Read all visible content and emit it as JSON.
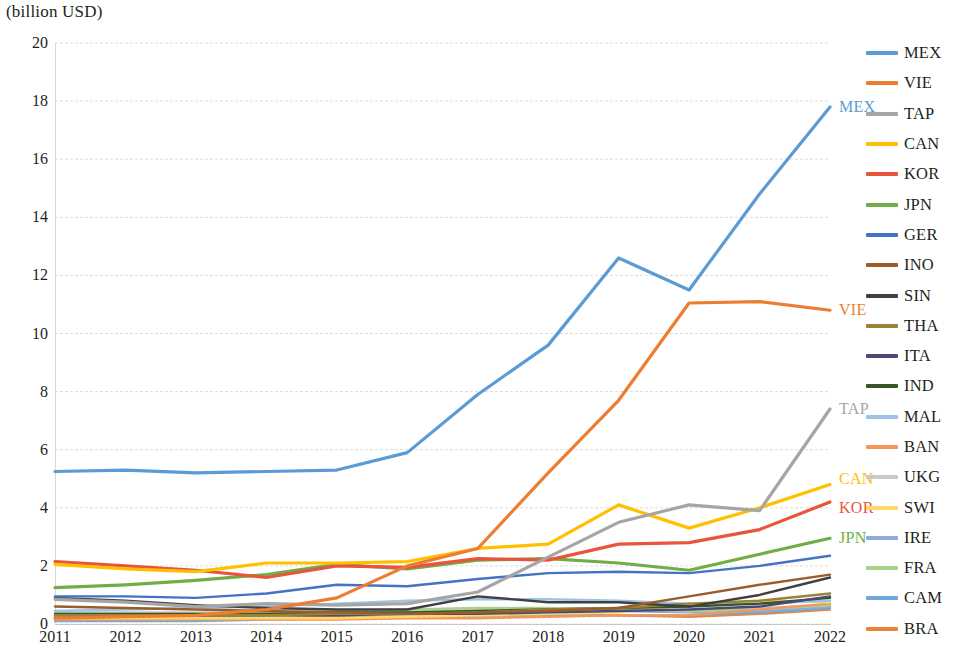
{
  "chart_data": {
    "type": "line",
    "title": "(billion USD)",
    "xlabel": "",
    "ylabel": "(billion USD)",
    "x": [
      2011,
      2012,
      2013,
      2014,
      2015,
      2016,
      2017,
      2018,
      2019,
      2020,
      2021,
      2022
    ],
    "xlim": [
      2011,
      2022
    ],
    "ylim": [
      0,
      20
    ],
    "yticks": [
      0,
      2,
      4,
      6,
      8,
      10,
      12,
      14,
      16,
      18,
      20
    ],
    "grid": true,
    "legend_position": "right",
    "series": [
      {
        "name": "MEX",
        "color": "#5B9BD5",
        "end_label": "MEX",
        "values": [
          5.25,
          5.3,
          5.2,
          5.25,
          5.3,
          5.9,
          7.9,
          9.6,
          12.6,
          11.5,
          14.8,
          17.8
        ]
      },
      {
        "name": "VIE",
        "color": "#ED7D31",
        "end_label": "VIE",
        "values": [
          0.2,
          0.25,
          0.3,
          0.5,
          0.9,
          2.0,
          2.6,
          5.2,
          7.7,
          11.05,
          11.1,
          10.8
        ]
      },
      {
        "name": "TAP",
        "color": "#A5A5A5",
        "end_label": "TAP",
        "values": [
          0.85,
          0.75,
          0.6,
          0.7,
          0.65,
          0.7,
          1.1,
          2.3,
          3.5,
          4.1,
          3.9,
          7.4
        ]
      },
      {
        "name": "CAN",
        "color": "#FFC000",
        "end_label": "CAN",
        "values": [
          2.05,
          1.9,
          1.8,
          2.1,
          2.1,
          2.15,
          2.6,
          2.75,
          4.1,
          3.3,
          4.0,
          4.8
        ]
      },
      {
        "name": "KOR",
        "color": "#E8553C",
        "end_label": "KOR",
        "values": [
          2.15,
          2.0,
          1.85,
          1.6,
          2.0,
          1.95,
          2.25,
          2.2,
          2.75,
          2.8,
          3.25,
          4.2
        ]
      },
      {
        "name": "JPN",
        "color": "#70AD47",
        "end_label": "JPN",
        "values": [
          1.25,
          1.35,
          1.5,
          1.7,
          2.05,
          1.9,
          2.2,
          2.25,
          2.1,
          1.85,
          2.4,
          2.95
        ]
      },
      {
        "name": "GER",
        "color": "#4472C4",
        "end_label": "",
        "values": [
          0.95,
          0.95,
          0.9,
          1.05,
          1.35,
          1.3,
          1.55,
          1.75,
          1.8,
          1.75,
          2.0,
          2.35
        ]
      },
      {
        "name": "INO",
        "color": "#9A5C2B",
        "end_label": "",
        "values": [
          0.6,
          0.55,
          0.5,
          0.45,
          0.4,
          0.35,
          0.4,
          0.45,
          0.55,
          0.95,
          1.35,
          1.7
        ]
      },
      {
        "name": "SIN",
        "color": "#404040",
        "end_label": "",
        "values": [
          0.9,
          0.8,
          0.65,
          0.55,
          0.5,
          0.5,
          0.95,
          0.75,
          0.75,
          0.6,
          1.0,
          1.6
        ]
      },
      {
        "name": "THA",
        "color": "#9A8236",
        "end_label": "",
        "values": [
          0.3,
          0.3,
          0.3,
          0.3,
          0.35,
          0.35,
          0.4,
          0.5,
          0.55,
          0.7,
          0.8,
          1.05
        ]
      },
      {
        "name": "ITA",
        "color": "#4A4A7A",
        "end_label": "",
        "values": [
          0.3,
          0.3,
          0.3,
          0.3,
          0.3,
          0.35,
          0.35,
          0.4,
          0.45,
          0.5,
          0.6,
          0.95
        ]
      },
      {
        "name": "IND",
        "color": "#375623",
        "end_label": "",
        "values": [
          0.35,
          0.35,
          0.35,
          0.35,
          0.4,
          0.4,
          0.45,
          0.5,
          0.55,
          0.6,
          0.7,
          0.9
        ]
      },
      {
        "name": "MAL",
        "color": "#9DC3E6",
        "end_label": "",
        "values": [
          0.45,
          0.5,
          0.55,
          0.6,
          0.7,
          0.8,
          0.85,
          0.85,
          0.8,
          0.7,
          0.7,
          0.8
        ]
      },
      {
        "name": "BAN",
        "color": "#F4975A",
        "end_label": "",
        "values": [
          0.15,
          0.15,
          0.15,
          0.15,
          0.15,
          0.2,
          0.2,
          0.25,
          0.3,
          0.3,
          0.5,
          0.7
        ]
      },
      {
        "name": "UKG",
        "color": "#C9C9C9",
        "end_label": "",
        "values": [
          0.4,
          0.4,
          0.4,
          0.4,
          0.45,
          0.45,
          0.5,
          0.5,
          0.5,
          0.45,
          0.55,
          0.65
        ]
      },
      {
        "name": "SWI",
        "color": "#FFD966",
        "end_label": "",
        "values": [
          0.2,
          0.2,
          0.2,
          0.2,
          0.2,
          0.25,
          0.3,
          0.35,
          0.4,
          0.65,
          0.8,
          0.75
        ]
      },
      {
        "name": "IRE",
        "color": "#8FAADC",
        "end_label": "",
        "values": [
          0.25,
          0.25,
          0.25,
          0.3,
          0.35,
          0.4,
          0.45,
          0.45,
          0.45,
          0.4,
          0.45,
          0.6
        ]
      },
      {
        "name": "FRA",
        "color": "#A9D18E",
        "end_label": "",
        "values": [
          0.3,
          0.3,
          0.35,
          0.4,
          0.45,
          0.5,
          0.55,
          0.55,
          0.5,
          0.45,
          0.5,
          0.65
        ]
      },
      {
        "name": "CAM",
        "color": "#6FA8DC",
        "end_label": "",
        "values": [
          0.1,
          0.1,
          0.1,
          0.15,
          0.2,
          0.25,
          0.3,
          0.3,
          0.3,
          0.3,
          0.4,
          0.55
        ]
      },
      {
        "name": "BRA",
        "color": "#E8833A",
        "end_label": "",
        "values": [
          0.2,
          0.2,
          0.2,
          0.2,
          0.25,
          0.25,
          0.3,
          0.3,
          0.3,
          0.25,
          0.35,
          0.5
        ]
      }
    ]
  },
  "legend": {
    "items": [
      {
        "label": "MEX",
        "color": "#5B9BD5"
      },
      {
        "label": "VIE",
        "color": "#ED7D31"
      },
      {
        "label": "TAP",
        "color": "#A5A5A5"
      },
      {
        "label": "CAN",
        "color": "#FFC000"
      },
      {
        "label": "KOR",
        "color": "#E8553C"
      },
      {
        "label": "JPN",
        "color": "#70AD47"
      },
      {
        "label": "GER",
        "color": "#4472C4"
      },
      {
        "label": "INO",
        "color": "#9A5C2B"
      },
      {
        "label": "SIN",
        "color": "#404040"
      },
      {
        "label": "THA",
        "color": "#9A8236"
      },
      {
        "label": "ITA",
        "color": "#4A4A7A"
      },
      {
        "label": "IND",
        "color": "#375623"
      },
      {
        "label": "MAL",
        "color": "#9DC3E6"
      },
      {
        "label": "BAN",
        "color": "#F4975A"
      },
      {
        "label": "UKG",
        "color": "#C9C9C9"
      },
      {
        "label": "SWI",
        "color": "#FFD966"
      },
      {
        "label": "IRE",
        "color": "#8FAADC"
      },
      {
        "label": "FRA",
        "color": "#A9D18E"
      },
      {
        "label": "CAM",
        "color": "#6FA8DC"
      },
      {
        "label": "BRA",
        "color": "#E8833A"
      }
    ]
  }
}
